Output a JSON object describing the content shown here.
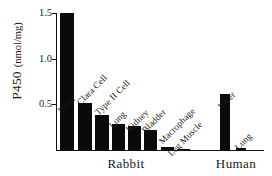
{
  "chart_data": {
    "type": "bar",
    "title": "",
    "xlabel": "",
    "ylabel": "P450 (nmol/mg)",
    "ylabel_main": "P450",
    "ylabel_unit": "(nmol/mg)",
    "ylim": [
      0,
      1.5
    ],
    "yticks": [
      0.5,
      1.0,
      1.5
    ],
    "ytick_labels": [
      "0.5",
      "1.0",
      "1.5"
    ],
    "grid": false,
    "legend": "none",
    "bar_color": "#0a0a0a",
    "axis_color": "#111111",
    "groups": [
      {
        "name": "Rabbit",
        "label": "Rabbit"
      },
      {
        "name": "Human",
        "label": "Human"
      }
    ],
    "categories": [
      "Liver",
      "Clara Cell",
      "Type II Cell",
      "Lung",
      "Kidney",
      "Bladder",
      "Macrophage",
      "Leg Muscle",
      "Liver",
      "Lung"
    ],
    "values": [
      1.5,
      0.51,
      0.38,
      0.29,
      0.26,
      0.22,
      0.03,
      0.01,
      0.61,
      0.02
    ],
    "bars": [
      {
        "label": "Liver",
        "value": 1.5,
        "group": "Rabbit"
      },
      {
        "label": "Clara Cell",
        "value": 0.51,
        "group": "Rabbit"
      },
      {
        "label": "Type II Cell",
        "value": 0.38,
        "group": "Rabbit"
      },
      {
        "label": "Lung",
        "value": 0.29,
        "group": "Rabbit"
      },
      {
        "label": "Kidney",
        "value": 0.26,
        "group": "Rabbit"
      },
      {
        "label": "Bladder",
        "value": 0.22,
        "group": "Rabbit"
      },
      {
        "label": "Macrophage",
        "value": 0.03,
        "group": "Rabbit"
      },
      {
        "label": "Leg Muscle",
        "value": 0.01,
        "group": "Rabbit"
      },
      {
        "label": "Liver",
        "value": 0.61,
        "group": "Human"
      },
      {
        "label": "Lung",
        "value": 0.02,
        "group": "Human"
      }
    ]
  }
}
